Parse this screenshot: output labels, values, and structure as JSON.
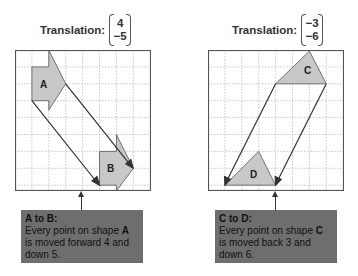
{
  "panels": [
    {
      "header_label": "Translation:",
      "vector": [
        "4",
        "−5"
      ],
      "shapes": [
        {
          "label": "A"
        },
        {
          "label": "B"
        }
      ],
      "note": {
        "title": "A to B:",
        "line1_prefix": "Every point on shape ",
        "line1_shape": "A",
        "line2": "is moved forward 4 and",
        "line3": "down 5."
      }
    },
    {
      "header_label": "Translation:",
      "vector": [
        "−3",
        "−6"
      ],
      "shapes": [
        {
          "label": "C"
        },
        {
          "label": "D"
        }
      ],
      "note": {
        "title": "C to D:",
        "line1_prefix": "Every point on shape ",
        "line1_shape": "C",
        "line2": "is moved back 3 and",
        "line3": "down 6."
      }
    }
  ],
  "colors": {
    "shape_fill": "#c8c8c8",
    "note_bg": "#6e6e6e",
    "grid_line": "#bbbbbb",
    "border": "#555555"
  }
}
